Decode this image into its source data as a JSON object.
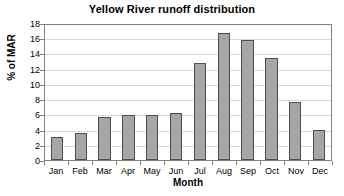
{
  "chart_data": {
    "type": "bar",
    "title": "Yellow River runoff distribution",
    "xlabel": "Month",
    "ylabel": "% of MAR",
    "categories": [
      "Jan",
      "Feb",
      "Mar",
      "Apr",
      "May",
      "Jun",
      "Jul",
      "Aug",
      "Sep",
      "Oct",
      "Nov",
      "Dec"
    ],
    "values": [
      3.0,
      3.5,
      5.6,
      5.9,
      5.9,
      6.2,
      12.8,
      16.7,
      15.8,
      13.4,
      7.6,
      3.9
    ],
    "ylim": [
      0,
      18
    ],
    "ytick_step": 2,
    "yticks": [
      0,
      2,
      4,
      6,
      8,
      10,
      12,
      14,
      16,
      18
    ],
    "ytick_labels": [
      "0",
      "2",
      "4",
      "6",
      "8",
      "10",
      "12",
      "14",
      "16",
      "18"
    ],
    "grid": true,
    "grid_axis": "y",
    "legend": false,
    "bar_color": "#a6a6a6",
    "bar_edge_color": "#4d4d4d",
    "grid_color": "#d9d9d9",
    "axis_color": "#808080",
    "plot_background": "#ffffff"
  }
}
